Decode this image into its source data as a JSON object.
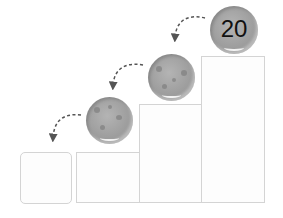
{
  "diagram": {
    "boxes": [
      {
        "id": "box-1",
        "state": "empty"
      },
      {
        "id": "box-2",
        "state": "holds cookie"
      },
      {
        "id": "box-3",
        "state": "holds cookie"
      },
      {
        "id": "box-4",
        "state": "holds cookie"
      }
    ],
    "cookies": [
      {
        "id": "cookie-1",
        "label": ""
      },
      {
        "id": "cookie-2",
        "label": ""
      },
      {
        "id": "cookie-3",
        "label": "20"
      }
    ],
    "arrows": [
      {
        "from": "cookie-3",
        "to": "cookie-2",
        "style": "dashed"
      },
      {
        "from": "cookie-2",
        "to": "cookie-1",
        "style": "dashed"
      },
      {
        "from": "cookie-1",
        "to": "box-1",
        "style": "dashed"
      }
    ],
    "colors": {
      "box_border": "#d4d4d4",
      "cookie": "#9e9e9e",
      "arrow": "#555555",
      "label": "#111111"
    }
  }
}
